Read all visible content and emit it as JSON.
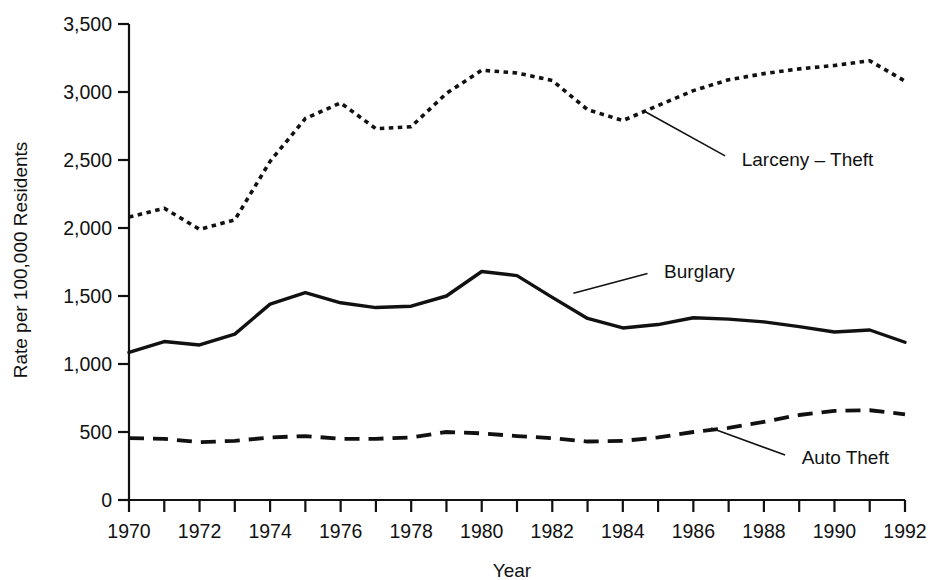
{
  "chart_data": {
    "type": "line",
    "title": "",
    "xlabel": "Year",
    "ylabel": "Rate per 100,000 Residents",
    "xlim": [
      1970,
      1992
    ],
    "ylim": [
      0,
      3500
    ],
    "grid": false,
    "legend_position": "inline-annotations",
    "x": [
      1970,
      1971,
      1972,
      1973,
      1974,
      1975,
      1976,
      1977,
      1978,
      1979,
      1980,
      1981,
      1982,
      1983,
      1984,
      1985,
      1986,
      1987,
      1988,
      1989,
      1990,
      1991,
      1992
    ],
    "x_tick_labels": [
      "1970",
      "1972",
      "1974",
      "1976",
      "1978",
      "1980",
      "1982",
      "1984",
      "1986",
      "1988",
      "1990",
      "1992"
    ],
    "x_tick_values": [
      1970,
      1972,
      1974,
      1976,
      1978,
      1980,
      1982,
      1984,
      1986,
      1988,
      1990,
      1992
    ],
    "y_tick_labels": [
      "0",
      "500",
      "1,000",
      "1,500",
      "2,000",
      "2,500",
      "3,000",
      "3,500"
    ],
    "y_tick_values": [
      0,
      500,
      1000,
      1500,
      2000,
      2500,
      3000,
      3500
    ],
    "series": [
      {
        "name": "Larceny – Theft",
        "style": "dotted",
        "color": "#111111",
        "values": [
          2080,
          2145,
          1990,
          2060,
          2490,
          2805,
          2920,
          2730,
          2745,
          2990,
          3160,
          3140,
          3085,
          2870,
          2790,
          2900,
          3010,
          3090,
          3135,
          3170,
          3195,
          3230,
          3080
        ]
      },
      {
        "name": "Burglary",
        "style": "solid",
        "color": "#111111",
        "values": [
          1085,
          1165,
          1140,
          1220,
          1440,
          1525,
          1450,
          1415,
          1425,
          1500,
          1680,
          1650,
          1490,
          1335,
          1265,
          1290,
          1340,
          1330,
          1310,
          1275,
          1235,
          1250,
          1160
        ]
      },
      {
        "name": "Auto Theft",
        "style": "dashed",
        "color": "#111111",
        "values": [
          455,
          450,
          425,
          435,
          460,
          470,
          450,
          450,
          460,
          500,
          490,
          470,
          455,
          430,
          435,
          460,
          500,
          530,
          575,
          625,
          655,
          660,
          630
        ]
      }
    ],
    "annotations": [
      {
        "label": "Larceny – Theft",
        "leader_from": {
          "x": 1984.6,
          "y": 2860
        },
        "leader_to": {
          "x": 1986.9,
          "y": 2530
        },
        "text_anchor": {
          "x": 1987.2,
          "y": 2510
        }
      },
      {
        "label": "Burglary",
        "leader_from": {
          "x": 1982.6,
          "y": 1520
        },
        "leader_to": {
          "x": 1984.7,
          "y": 1665
        },
        "text_anchor": {
          "x": 1985.0,
          "y": 1685
        }
      },
      {
        "label": "Auto Theft",
        "leader_from": {
          "x": 1986.5,
          "y": 530
        },
        "leader_to": {
          "x": 1988.6,
          "y": 330
        },
        "text_anchor": {
          "x": 1988.9,
          "y": 315
        }
      }
    ]
  }
}
